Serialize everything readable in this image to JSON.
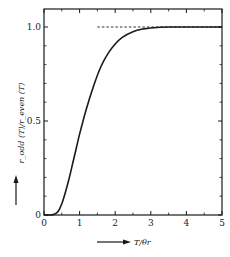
{
  "chart_data": {
    "type": "line",
    "title": "",
    "xlabel": "T/θr",
    "ylabel": "r_odd(T)/r_even(T)",
    "xlim": [
      0,
      5
    ],
    "ylim": [
      0,
      1.1
    ],
    "x_ticks": [
      0,
      1,
      2,
      3,
      4,
      5
    ],
    "x_tick_labels": [
      "0",
      "1",
      "2",
      "3",
      "4",
      "5"
    ],
    "x_minor_ticks": [
      0.5,
      1.5,
      2.5,
      3.5,
      4.5
    ],
    "y_ticks": [
      0,
      0.5,
      1.0
    ],
    "y_tick_labels": [
      "0",
      "0.5",
      "1.0"
    ],
    "y_minor_step": 0.1,
    "grid": false,
    "legend": null,
    "series": [
      {
        "name": "r_odd/r_even",
        "style": "solid",
        "x": [
          0,
          0.2,
          0.3,
          0.4,
          0.5,
          0.6,
          0.7,
          0.8,
          0.9,
          1.0,
          1.2,
          1.4,
          1.6,
          1.8,
          2.0,
          2.2,
          2.5,
          2.8,
          3.0,
          3.5,
          4.0,
          5.0
        ],
        "values": [
          0.0,
          0.0,
          0.005,
          0.02,
          0.06,
          0.12,
          0.19,
          0.27,
          0.35,
          0.43,
          0.57,
          0.69,
          0.79,
          0.86,
          0.91,
          0.945,
          0.975,
          0.99,
          0.995,
          1.0,
          1.0,
          1.0
        ]
      },
      {
        "name": "limit",
        "style": "dashed",
        "x": [
          1.5,
          5.0
        ],
        "values": [
          1.0,
          1.0
        ]
      }
    ],
    "annotations": [
      {
        "type": "arrow",
        "text": "↑",
        "near": "ylabel"
      },
      {
        "type": "arrow",
        "text": "→",
        "near": "xlabel"
      }
    ]
  },
  "labels": {
    "xlabel": "T/θr",
    "ylabel": "r_odd (T)/r_even (T)"
  }
}
